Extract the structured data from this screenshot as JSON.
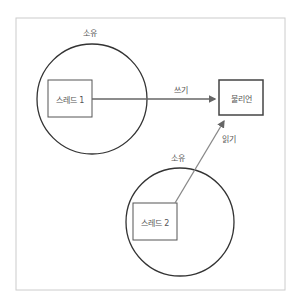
{
  "diagram": {
    "owner_label_1": "소유",
    "owner_label_2": "소유",
    "thread1": "스레드 1",
    "thread2": "스레드 2",
    "boolean": "불리언",
    "write": "쓰기",
    "read": "읽기"
  },
  "colors": {
    "frame": "#cccccc",
    "circle": "#333333",
    "box": "#555555",
    "arrow": "#666666",
    "text": "#555555"
  }
}
